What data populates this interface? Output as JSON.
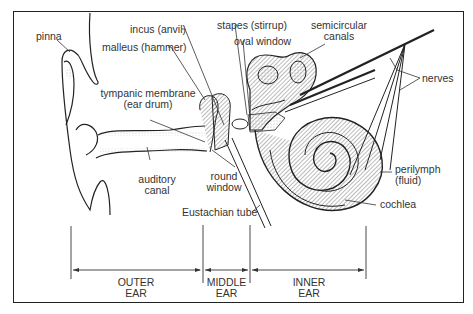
{
  "labels": {
    "pinna": "pinna",
    "malleus": "malleus (hammer)",
    "incus": "incus (anvil)",
    "stapes": "stapes (stirrup)",
    "oval_window": "oval window",
    "semicircular_1": "semicircular",
    "semicircular_2": "canals",
    "nerves": "nerves",
    "tympanic_1": "tympanic membrane",
    "tympanic_2": "(ear drum)",
    "auditory_1": "auditory",
    "auditory_2": "canal",
    "round_1": "round",
    "round_2": "window",
    "perilymph_1": "perilymph",
    "perilymph_2": "(fluid)",
    "cochlea": "cochlea",
    "eustachian": "Eustachian tube"
  },
  "regions": [
    {
      "line1": "OUTER",
      "line2": "EAR"
    },
    {
      "line1": "MIDDLE",
      "line2": "EAR"
    },
    {
      "line1": "INNER",
      "line2": "EAR"
    }
  ],
  "colors": {
    "ink": "#222222",
    "text": "#333333",
    "background": "#ffffff"
  }
}
